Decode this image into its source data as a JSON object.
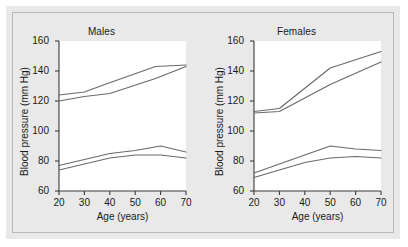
{
  "figure": {
    "background_color": "#e9e9e9",
    "line_color": "#6a6a6a",
    "axis_color": "#3c3c3c"
  },
  "chart_data": [
    {
      "type": "line",
      "title": "Males",
      "xlabel": "Age (years)",
      "ylabel": "Blood pressure (mm Hg)",
      "xlim": [
        20,
        70
      ],
      "ylim": [
        60,
        160
      ],
      "xticks": [
        20,
        30,
        40,
        50,
        60,
        70
      ],
      "yticks": [
        60,
        80,
        100,
        120,
        140,
        160
      ],
      "grid": false,
      "legend": "none",
      "series": [
        {
          "name": "Systolic upper",
          "x": [
            20,
            30,
            38,
            58,
            70
          ],
          "values": [
            124,
            126,
            131,
            143,
            144
          ]
        },
        {
          "name": "Systolic lower",
          "x": [
            20,
            30,
            40,
            58,
            70
          ],
          "values": [
            120,
            123,
            125,
            135,
            143
          ]
        },
        {
          "name": "Diastolic upper",
          "x": [
            20,
            30,
            40,
            50,
            60,
            70
          ],
          "values": [
            77,
            81,
            85,
            87,
            90,
            86
          ]
        },
        {
          "name": "Diastolic lower",
          "x": [
            20,
            30,
            40,
            50,
            60,
            70
          ],
          "values": [
            74,
            78,
            82,
            84,
            84,
            82
          ]
        }
      ]
    },
    {
      "type": "line",
      "title": "Females",
      "xlabel": "Age (years)",
      "ylabel": "Blood pressure (mm Hg)",
      "xlim": [
        20,
        70
      ],
      "ylim": [
        60,
        160
      ],
      "xticks": [
        20,
        30,
        40,
        50,
        60,
        70
      ],
      "yticks": [
        60,
        80,
        100,
        120,
        140,
        160
      ],
      "grid": false,
      "legend": "none",
      "series": [
        {
          "name": "Systolic upper",
          "x": [
            20,
            30,
            50,
            70
          ],
          "values": [
            113,
            115,
            142,
            153
          ]
        },
        {
          "name": "Systolic lower",
          "x": [
            20,
            30,
            50,
            70
          ],
          "values": [
            112,
            113,
            131,
            146
          ]
        },
        {
          "name": "Diastolic upper",
          "x": [
            20,
            30,
            40,
            50,
            60,
            70
          ],
          "values": [
            72,
            78,
            84,
            90,
            88,
            87
          ]
        },
        {
          "name": "Diastolic lower",
          "x": [
            20,
            30,
            40,
            50,
            60,
            70
          ],
          "values": [
            69,
            74,
            79,
            82,
            83,
            82
          ]
        }
      ]
    }
  ]
}
